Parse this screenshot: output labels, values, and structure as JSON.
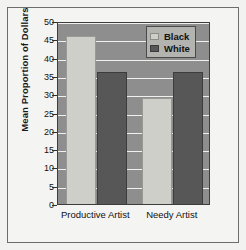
{
  "chart_data": {
    "type": "bar",
    "title": "",
    "xlabel": "",
    "ylabel": "Mean Proportion of Dollars",
    "categories": [
      "Productive Artist",
      "Needy Artist"
    ],
    "series": [
      {
        "name": "Black",
        "values": [
          46,
          29
        ],
        "color": "#cfcfc9"
      },
      {
        "name": "White",
        "values": [
          36,
          36
        ],
        "color": "#575757"
      }
    ],
    "ylim": [
      0,
      50
    ],
    "yticks": [
      0,
      5,
      10,
      15,
      20,
      25,
      30,
      35,
      40,
      45,
      50
    ],
    "ytick_labels": [
      "0",
      "5",
      "10",
      "15",
      "20",
      "25",
      "30",
      "35",
      "40",
      "45",
      "50"
    ],
    "grid": true,
    "grid_axis": "y",
    "legend_position": "top-right",
    "plot_background": "#8e8e8e",
    "gridline_color": "#f0f0ee",
    "figure_background": "#f4f4f2",
    "frame_color": "#6d6d6d"
  },
  "legend": {
    "entries": [
      {
        "label": "Black",
        "swatch": "black"
      },
      {
        "label": "White",
        "swatch": "white"
      }
    ]
  },
  "axes": {
    "y_title": "Mean Proportion of Dollars",
    "y_tick_0": "0",
    "y_tick_1": "5",
    "y_tick_2": "10",
    "y_tick_3": "15",
    "y_tick_4": "20",
    "y_tick_5": "25",
    "y_tick_6": "30",
    "y_tick_7": "35",
    "y_tick_8": "40",
    "y_tick_9": "45",
    "y_tick_10": "50",
    "x_tick_0": "Productive Artist",
    "x_tick_1": "Needy Artist"
  }
}
